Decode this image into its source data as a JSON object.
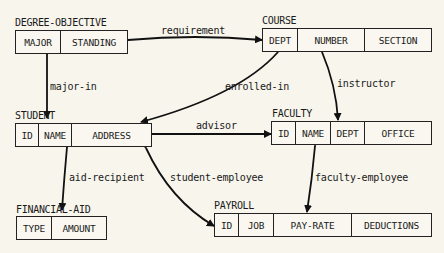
{
  "entities": {
    "degree_objective": {
      "title": "DEGREE-OBJECTIVE",
      "attributes": [
        "MAJOR",
        "STANDING"
      ]
    },
    "course": {
      "title": "COURSE",
      "attributes": [
        "DEPT",
        "NUMBER",
        "SECTION"
      ]
    },
    "student": {
      "title": "STUDENT",
      "attributes": [
        "ID",
        "NAME",
        "ADDRESS"
      ]
    },
    "faculty": {
      "title": "FACULTY",
      "attributes": [
        "ID",
        "NAME",
        "DEPT",
        "OFFICE"
      ]
    },
    "financial_aid": {
      "title": "FINANCIAL-AID",
      "attributes": [
        "TYPE",
        "AMOUNT"
      ]
    },
    "payroll": {
      "title": "PAYROLL",
      "attributes": [
        "ID",
        "JOB",
        "PAY-RATE",
        "DEDUCTIONS"
      ]
    }
  },
  "relationships": {
    "requirement": "requirement",
    "major_in": "major-in",
    "enrolled_in": "enrolled-in",
    "instructor": "instructor",
    "advisor": "advisor",
    "aid_recipient": "aid-recipient",
    "student_employee": "student-employee",
    "faculty_employee": "faculty-employee"
  }
}
